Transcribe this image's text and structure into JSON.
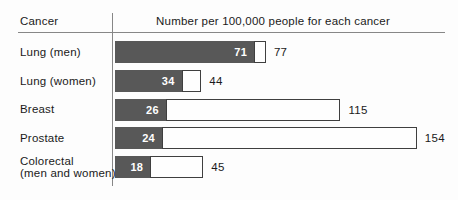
{
  "colors": {
    "background": "#fdfdfd",
    "text": "#1a1a1a",
    "axis_lines": "#878787",
    "filled_bar": "#585858",
    "filled_bar_label": "#ffffff",
    "outline_bar_fill": "#fefefe",
    "outline_bar_border": "#3f3f3f"
  },
  "chart_data": {
    "type": "bar",
    "orientation": "horizontal",
    "title": "",
    "column_headers": {
      "category": "Cancer",
      "values": "Number per 100,000 people for each cancer"
    },
    "categories": [
      "Lung (men)",
      "Lung (women)",
      "Breast",
      "Prostate",
      "Colorectal\n(men and women)"
    ],
    "series": [
      {
        "name": "filled-dark-bar",
        "values": [
          71,
          34,
          26,
          24,
          18
        ]
      },
      {
        "name": "outlined-white-bar-total",
        "values": [
          77,
          44,
          115,
          154,
          45
        ]
      }
    ],
    "value_label_positions": {
      "filled-dark-bar": "inside-right",
      "outlined-white-bar-total": "outside-right"
    },
    "xlim": [
      0,
      168
    ],
    "grid": false,
    "legend": false
  }
}
